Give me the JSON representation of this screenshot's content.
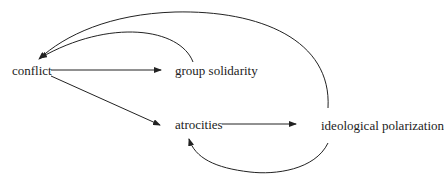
{
  "diagram": {
    "type": "causal-loop",
    "nodes": [
      {
        "id": "conflict",
        "label": "conflict"
      },
      {
        "id": "group_solidarity",
        "label": "group solidarity"
      },
      {
        "id": "atrocities",
        "label": "atrocities"
      },
      {
        "id": "ideological_polarization",
        "label": "ideological polarization"
      }
    ],
    "edges": [
      {
        "from": "conflict",
        "to": "group_solidarity"
      },
      {
        "from": "conflict",
        "to": "atrocities"
      },
      {
        "from": "atrocities",
        "to": "ideological_polarization"
      },
      {
        "from": "group_solidarity",
        "to": "conflict"
      },
      {
        "from": "ideological_polarization",
        "to": "conflict"
      },
      {
        "from": "ideological_polarization",
        "to": "atrocities"
      }
    ],
    "colors": {
      "line": "#222222",
      "text": "#222222",
      "background": "#ffffff"
    }
  }
}
